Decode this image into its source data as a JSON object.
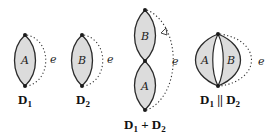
{
  "diagrams": [
    {
      "id": "D1",
      "region_labels": [
        "A"
      ],
      "edge_label": "e",
      "caption": {
        "main": "D",
        "sub": "1",
        "rest": ""
      }
    },
    {
      "id": "D2",
      "region_labels": [
        "B"
      ],
      "edge_label": "e",
      "caption": {
        "main": "D",
        "sub": "2",
        "rest": ""
      }
    },
    {
      "id": "D1_plus_D2",
      "region_labels": [
        "B",
        "A"
      ],
      "edge_label": "e",
      "caption": {
        "main": "D",
        "sub": "1",
        "op": " + ",
        "main2": "D",
        "sub2": "2"
      }
    },
    {
      "id": "D1_par_D2",
      "region_labels": [
        "A",
        "B"
      ],
      "edge_label": "e",
      "caption": {
        "main": "D",
        "sub": "1",
        "op": " || ",
        "main2": "D",
        "sub2": "2"
      }
    }
  ],
  "colors": {
    "fill": "#dcdcdc",
    "stroke": "#2a2a2a",
    "background": "#ffffff"
  }
}
